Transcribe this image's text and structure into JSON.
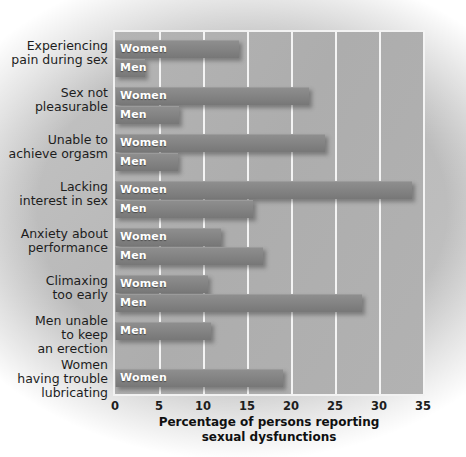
{
  "chart_data": {
    "type": "bar",
    "orientation": "horizontal",
    "title": "",
    "xlabel": "Percentage of persons reporting sexual dysfunctions",
    "ylabel": "",
    "xlim": [
      0,
      35
    ],
    "xticks": [
      0,
      5,
      10,
      15,
      20,
      25,
      30,
      35
    ],
    "grid": true,
    "legend": "none",
    "categories": [
      "Experiencing pain during sex",
      "Sex not pleasurable",
      "Unable to achieve orgasm",
      "Lacking interest in sex",
      "Anxiety about performance",
      "Climaxing too early",
      "Men unable to keep an erection",
      "Women having trouble lubricating"
    ],
    "category_lines": [
      [
        "Experiencing",
        "pain during sex"
      ],
      [
        "Sex not",
        "pleasurable"
      ],
      [
        "Unable to",
        "achieve orgasm"
      ],
      [
        "Lacking",
        "interest in sex"
      ],
      [
        "Anxiety about",
        "performance"
      ],
      [
        "Climaxing",
        "too early"
      ],
      [
        "Men unable",
        "to keep",
        "an erection"
      ],
      [
        "Women",
        "having trouble",
        "lubricating"
      ]
    ],
    "groups": [
      {
        "category": "Experiencing pain during sex",
        "bars": [
          {
            "series": "Women",
            "value": 14.1
          },
          {
            "series": "Men",
            "value": 2.7
          }
        ]
      },
      {
        "category": "Sex not pleasurable",
        "bars": [
          {
            "series": "Women",
            "value": 22.0
          },
          {
            "series": "Men",
            "value": 7.3
          }
        ]
      },
      {
        "category": "Unable to achieve orgasm",
        "bars": [
          {
            "series": "Women",
            "value": 23.9
          },
          {
            "series": "Men",
            "value": 7.2
          }
        ]
      },
      {
        "category": "Lacking interest in sex",
        "bars": [
          {
            "series": "Women",
            "value": 33.7
          },
          {
            "series": "Men",
            "value": 15.7
          }
        ]
      },
      {
        "category": "Anxiety about performance",
        "bars": [
          {
            "series": "Women",
            "value": 12.1
          },
          {
            "series": "Men",
            "value": 16.8
          }
        ]
      },
      {
        "category": "Climaxing too early",
        "bars": [
          {
            "series": "Women",
            "value": 10.6
          },
          {
            "series": "Men",
            "value": 28.1
          }
        ]
      },
      {
        "category": "Men unable to keep an erection",
        "bars": [
          {
            "series": "Men",
            "value": 10.9
          }
        ]
      },
      {
        "category": "Women having trouble lubricating",
        "bars": [
          {
            "series": "Women",
            "value": 19.1
          }
        ]
      }
    ],
    "series": [
      {
        "name": "Women",
        "values": [
          14.1,
          22.0,
          23.9,
          33.7,
          12.1,
          10.6,
          null,
          19.1
        ]
      },
      {
        "name": "Men",
        "values": [
          2.7,
          7.3,
          7.2,
          15.7,
          16.8,
          28.1,
          10.9,
          null
        ]
      }
    ],
    "colors": {
      "bar": "#848484",
      "plot_background": "#b0b0b0",
      "gridline": "#f4f4f4",
      "frame": "#f2f2f2",
      "figure_background": "#bdbdbd",
      "bar_label_text": "#ffffff",
      "axis_text": "#1d1d1d"
    }
  },
  "axis": {
    "title_line1": "Percentage of persons reporting",
    "title_line2": "sexual dysfunctions",
    "tick_labels": [
      "0",
      "5",
      "10",
      "15",
      "20",
      "25",
      "30",
      "35"
    ]
  }
}
